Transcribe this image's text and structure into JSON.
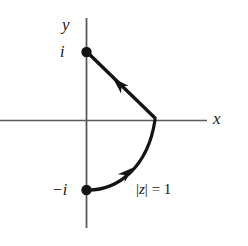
{
  "figure": {
    "kind": "complex-plane-contour-diagram",
    "background_color": "#ffffff",
    "axis_color": "#5a5a5a",
    "curve_color": "#141414",
    "text_color": "#141414",
    "axes": {
      "x_axis_label": "x",
      "y_axis_label": "y",
      "origin": {
        "x": 86,
        "y": 120
      },
      "x_axis_extent": {
        "x1": 0,
        "x2": 207,
        "y": 120
      },
      "y_axis_extent": {
        "y1": 18,
        "y2": 228,
        "x": 86
      }
    },
    "tick_labels": {
      "imaginary_positive": "i",
      "imaginary_negative": "−i"
    },
    "points": [
      {
        "name": "point-i",
        "label": "i",
        "x": 86,
        "y": 52,
        "marker": "filled-dot"
      },
      {
        "name": "point-neg-i",
        "label": "−i",
        "x": 86,
        "y": 190,
        "marker": "filled-dot"
      }
    ],
    "annotations": {
      "curve_label_bars": "|",
      "curve_label_variable": "z",
      "curve_label_equals_value": " = 1",
      "curve_label_full": "|z| = 1"
    },
    "paths": [
      {
        "name": "arc-unit-circle-right-half",
        "description": "semicircular arc of radius 1 from -i counterclockwise-right through 1 to i-side junction",
        "direction": "from -i upward to the point 1 on the x-axis",
        "arrow": {
          "x": 128,
          "y": 172,
          "angle_deg": -40
        }
      },
      {
        "name": "segment-one-to-i",
        "description": "straight line segment from the point 1 on the x-axis to the point i",
        "direction": "from 1 toward i",
        "arrow": {
          "x": 118,
          "y": 83,
          "angle_deg": 223
        }
      }
    ]
  }
}
